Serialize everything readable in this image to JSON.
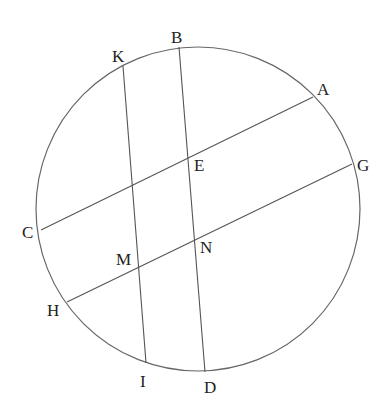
{
  "diagram": {
    "type": "geometry",
    "colors": {
      "stroke": "#555555",
      "label": "#222222",
      "background": "#ffffff"
    },
    "circle": {
      "cx": 198,
      "cy": 209,
      "r": 162
    },
    "points": {
      "A": {
        "label": "A",
        "x": 313,
        "y": 97
      },
      "B": {
        "label": "B",
        "x": 179,
        "y": 47
      },
      "C": {
        "label": "C",
        "x": 41,
        "y": 230
      },
      "D": {
        "label": "D",
        "x": 205,
        "y": 372
      },
      "E": {
        "label": "E",
        "x": 187,
        "y": 157
      },
      "G": {
        "label": "G",
        "x": 352,
        "y": 164
      },
      "H": {
        "label": "H",
        "x": 67,
        "y": 302
      },
      "I": {
        "label": "I",
        "x": 146,
        "y": 363
      },
      "K": {
        "label": "K",
        "x": 123,
        "y": 66
      },
      "M": {
        "label": "M",
        "x": 138,
        "y": 267
      },
      "N": {
        "label": "N",
        "x": 194,
        "y": 239
      }
    },
    "chords": [
      {
        "name": "AC",
        "from": "A",
        "to": "C"
      },
      {
        "name": "GH",
        "from": "G",
        "to": "H"
      },
      {
        "name": "BD",
        "from": "B",
        "to": "D"
      },
      {
        "name": "KI",
        "from": "K",
        "to": "I"
      }
    ]
  }
}
